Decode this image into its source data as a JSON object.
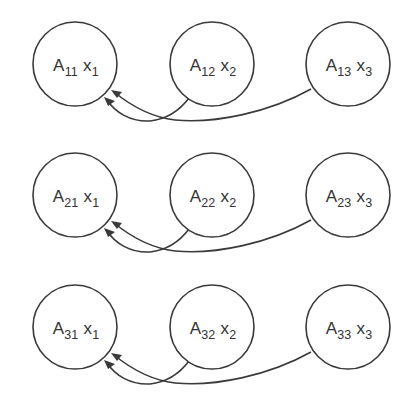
{
  "diagram": {
    "type": "matrix-vector product dependency graph",
    "rows": [
      {
        "nodes": [
          {
            "matrix": "A",
            "matrix_sub": "11",
            "vector": "x",
            "vector_sub": "1"
          },
          {
            "matrix": "A",
            "matrix_sub": "12",
            "vector": "x",
            "vector_sub": "2"
          },
          {
            "matrix": "A",
            "matrix_sub": "13",
            "vector": "x",
            "vector_sub": "3"
          }
        ],
        "edges": [
          {
            "from": 1,
            "to": 0
          },
          {
            "from": 2,
            "to": 0
          }
        ]
      },
      {
        "nodes": [
          {
            "matrix": "A",
            "matrix_sub": "21",
            "vector": "x",
            "vector_sub": "1"
          },
          {
            "matrix": "A",
            "matrix_sub": "22",
            "vector": "x",
            "vector_sub": "2"
          },
          {
            "matrix": "A",
            "matrix_sub": "23",
            "vector": "x",
            "vector_sub": "3"
          }
        ],
        "edges": [
          {
            "from": 1,
            "to": 0
          },
          {
            "from": 2,
            "to": 0
          }
        ]
      },
      {
        "nodes": [
          {
            "matrix": "A",
            "matrix_sub": "31",
            "vector": "x",
            "vector_sub": "1"
          },
          {
            "matrix": "A",
            "matrix_sub": "32",
            "vector": "x",
            "vector_sub": "2"
          },
          {
            "matrix": "A",
            "matrix_sub": "33",
            "vector": "x",
            "vector_sub": "3"
          }
        ],
        "edges": [
          {
            "from": 1,
            "to": 0
          },
          {
            "from": 2,
            "to": 0
          }
        ]
      }
    ],
    "colors": {
      "stroke": "#3a3a3a",
      "text": "#333333",
      "background": "#ffffff"
    }
  }
}
